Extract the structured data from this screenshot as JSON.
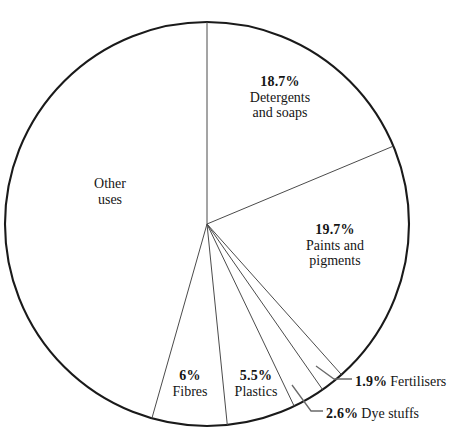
{
  "chart_data": {
    "type": "pie",
    "title": "",
    "subtitle": "",
    "xlabel": "",
    "ylabel": "",
    "legend": "none",
    "grid": false,
    "start_angle_deg": 0,
    "direction": "clockwise",
    "units": "percent",
    "center": {
      "cx": 207,
      "cy": 224,
      "r": 202
    },
    "stroke_color": "#1a1a1a",
    "fill_color": "#ffffff",
    "categories": [
      "Detergents and soaps",
      "Paints and pigments",
      "Fertilisers",
      "Dye stuffs",
      "Plastics",
      "Fibres",
      "Other uses"
    ],
    "values": [
      18.7,
      19.7,
      1.9,
      2.6,
      5.5,
      6.0,
      45.6
    ],
    "slices": [
      {
        "id": "detergents",
        "pct_text": "18.7%",
        "name_line1": "Detergents",
        "name_line2": "and soaps",
        "value": 18.7,
        "label_style": "inside-stack"
      },
      {
        "id": "paints",
        "pct_text": "19.7%",
        "name_line1": "Paints and",
        "name_line2": "pigments",
        "value": 19.7,
        "label_style": "inside-stack"
      },
      {
        "id": "fertilisers",
        "pct_text": "1.9%",
        "name_line1": "Fertilisers",
        "name_line2": "",
        "value": 1.9,
        "label_style": "leader-right"
      },
      {
        "id": "dyestuffs",
        "pct_text": "2.6%",
        "name_line1": "Dye stuffs",
        "name_line2": "",
        "value": 2.6,
        "label_style": "leader-right"
      },
      {
        "id": "plastics",
        "pct_text": "5.5%",
        "name_line1": "Plastics",
        "name_line2": "",
        "value": 5.5,
        "label_style": "inside-stack"
      },
      {
        "id": "fibres",
        "pct_text": "6%",
        "name_line1": "Fibres",
        "name_line2": "",
        "value": 6.0,
        "label_style": "inside-stack"
      },
      {
        "id": "other",
        "pct_text": "",
        "name_line1": "Other",
        "name_line2": "uses",
        "value": 45.6,
        "label_style": "inside-stack"
      }
    ]
  },
  "labels": {
    "detergents": {
      "pct": "18.7%",
      "line1": "Detergents",
      "line2": "and soaps"
    },
    "paints": {
      "pct": "19.7%",
      "line1": "Paints and",
      "line2": "pigments"
    },
    "other": {
      "pct": "",
      "line1": "Other",
      "line2": "uses"
    },
    "fibres": {
      "pct": "6%",
      "line1": "Fibres",
      "line2": ""
    },
    "plastics": {
      "pct": "5.5%",
      "line1": "Plastics",
      "line2": ""
    },
    "fertilisers": {
      "pct": "1.9%",
      "line1": "Fertilisers",
      "line2": ""
    },
    "dyestuffs": {
      "pct": "2.6%",
      "line1": "Dye stuffs",
      "line2": ""
    }
  }
}
